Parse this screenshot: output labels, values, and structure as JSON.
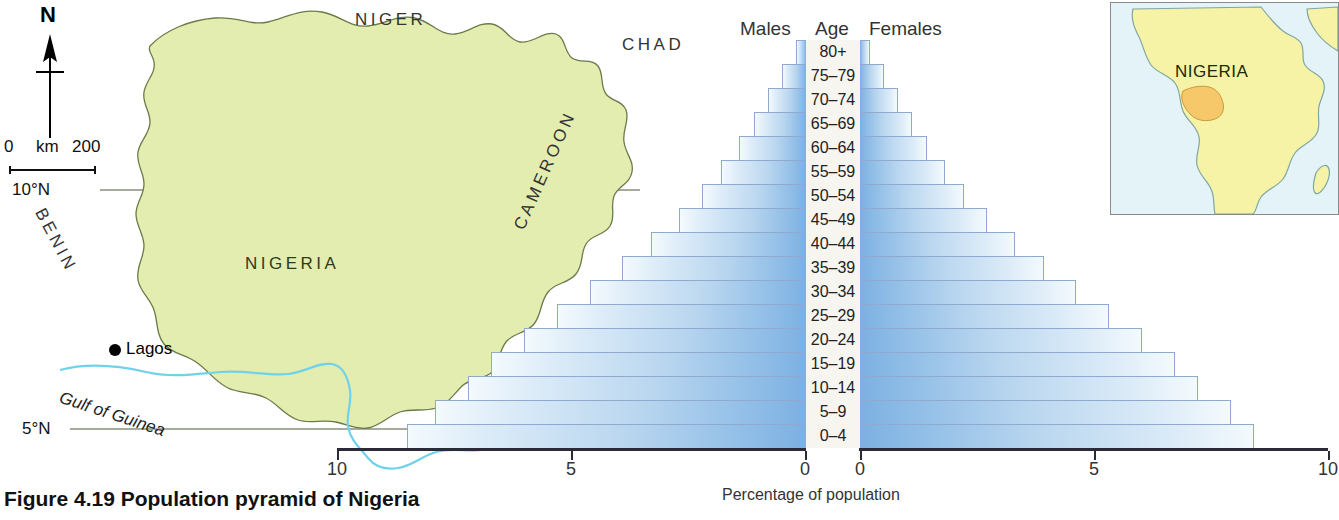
{
  "figure": {
    "caption": "Figure 4.19 Population pyramid of Nigeria"
  },
  "map": {
    "north_letter": "N",
    "north_arrow_icon": "north-arrow-icon",
    "scale": {
      "zero": "0",
      "unit": "km",
      "max": "200"
    },
    "latitudes": [
      {
        "label": "10°N"
      },
      {
        "label": "5°N"
      }
    ],
    "countries_outside": [
      {
        "label": "NIGER"
      },
      {
        "label": "CHAD"
      },
      {
        "label": "BENIN"
      },
      {
        "label": "CAMEROON"
      }
    ],
    "country_main": "NIGERIA",
    "water_label": "Gulf of Guinea",
    "city": {
      "name": "Lagos",
      "marker_icon": "city-dot-icon"
    },
    "colors": {
      "land": "#e3edb0",
      "land_border": "#6b7a4a",
      "coast": "#6fd2ea",
      "graticule": "#4f5a3c"
    }
  },
  "inset": {
    "title": "NIGERIA",
    "colors": {
      "ocean": "#e4f3f8",
      "continent": "#f6f3a6",
      "highlight": "#f7c86a",
      "border": "#7fa6a2"
    }
  },
  "chart_data": {
    "type": "bar",
    "subtype": "population-pyramid",
    "title": "Population pyramid of Nigeria",
    "xlabel": "Percentage of population",
    "ylabel": "Age",
    "grid": false,
    "legend_position": "top",
    "xlim_left": [
      10,
      0
    ],
    "xlim_right": [
      0,
      10
    ],
    "xticks_left": [
      "10",
      "5",
      "0"
    ],
    "xticks_right": [
      "0",
      "5",
      "10"
    ],
    "headers": {
      "left": "Males",
      "center": "Age",
      "right": "Females"
    },
    "categories": [
      "80+",
      "75–79",
      "70–74",
      "65–69",
      "60–64",
      "55–59",
      "50–54",
      "45–49",
      "40–44",
      "35–39",
      "30–34",
      "25–29",
      "20–24",
      "15–19",
      "10–14",
      "5–9",
      "0–4"
    ],
    "series": [
      {
        "name": "Males",
        "values": [
          0.2,
          0.5,
          0.8,
          1.1,
          1.4,
          1.8,
          2.2,
          2.7,
          3.3,
          3.9,
          4.6,
          5.3,
          6.0,
          6.7,
          7.2,
          7.9,
          8.5
        ]
      },
      {
        "name": "Females",
        "values": [
          0.2,
          0.5,
          0.8,
          1.1,
          1.4,
          1.8,
          2.2,
          2.7,
          3.3,
          3.9,
          4.6,
          5.3,
          6.0,
          6.7,
          7.2,
          7.9,
          8.4
        ]
      }
    ],
    "colors": {
      "bar_inner": "#7cb0e2",
      "bar_outer": "#f4fafd",
      "bar_border": "#8fa9cf",
      "axis": "#2b2b38"
    }
  }
}
